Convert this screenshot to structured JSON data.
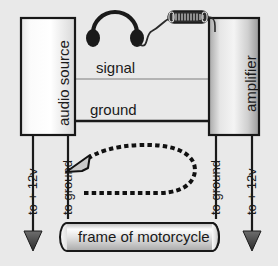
{
  "diagram": {
    "background_color": "#e9e9e9",
    "ink_color": "#1a1a1a",
    "boxes": {
      "audio_source": {
        "label": "audio source",
        "fill_light": "#ffffff",
        "fill_dark": "#d2d2d2"
      },
      "amplifier": {
        "label": "amplifier",
        "fill_light": "#f2f2f2",
        "fill_dark": "#9a9a9a"
      },
      "frame": {
        "label": "frame of motorcycle",
        "fill_light": "#ffffff",
        "fill_dark": "#b4b4b4"
      }
    },
    "wires": {
      "signal": {
        "label": "signal",
        "color": "#b0b0b0"
      },
      "ground": {
        "label": "ground",
        "color": "#1a1a1a"
      }
    },
    "labels": {
      "left_power": "to + 12v",
      "left_ground": "to ground",
      "right_ground": "to ground",
      "right_power": "to + 12v"
    },
    "icons": {
      "headphones": "headphones-icon",
      "microphone": "microphone-icon",
      "current_loop": "current-loop-arrow-icon",
      "left_power_arrow": "down-arrow-icon",
      "right_power_arrow": "down-arrow-icon"
    }
  }
}
